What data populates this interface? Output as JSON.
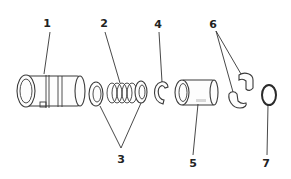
{
  "diagram": {
    "type": "exploded parts view",
    "background": "#ffffff",
    "line_color": "#3a3a3a",
    "callouts": [
      {
        "id": "1",
        "label": "1",
        "part": "housing / main sleeve"
      },
      {
        "id": "2",
        "label": "2",
        "part": "coil spring"
      },
      {
        "id": "3",
        "label": "3",
        "part": "washers (pair)"
      },
      {
        "id": "4",
        "label": "4",
        "part": "retaining clip"
      },
      {
        "id": "5",
        "label": "5",
        "part": "bushing / sleeve"
      },
      {
        "id": "6",
        "label": "6",
        "part": "half-collets (pair)"
      },
      {
        "id": "7",
        "label": "7",
        "part": "O-ring"
      }
    ]
  }
}
